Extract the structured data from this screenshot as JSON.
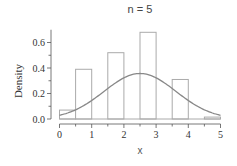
{
  "chart_data": {
    "type": "bar",
    "subtype": "histogram_with_density_curve",
    "title": "n = 5",
    "xlabel": "x",
    "ylabel": "Density",
    "xlim": [
      0,
      5
    ],
    "ylim": [
      0,
      0.7
    ],
    "x_ticks": [
      0,
      1,
      2,
      3,
      4,
      5
    ],
    "x_tick_labels": [
      "0",
      "1",
      "2",
      "3",
      "4",
      "5"
    ],
    "y_ticks": [
      0.0,
      0.2,
      0.4,
      0.6
    ],
    "y_tick_labels": [
      "0.0",
      "0.2",
      "0.4",
      "0.6"
    ],
    "y_minor_ticks": [
      0.1,
      0.3,
      0.5
    ],
    "grid": false,
    "legend": null,
    "bins": [
      {
        "x0": 0.0,
        "x1": 0.5,
        "density": 0.07
      },
      {
        "x0": 0.5,
        "x1": 1.0,
        "density": 0.39
      },
      {
        "x0": 1.5,
        "x1": 2.0,
        "density": 0.52
      },
      {
        "x0": 2.5,
        "x1": 3.0,
        "density": 0.68
      },
      {
        "x0": 3.5,
        "x1": 4.0,
        "density": 0.31
      },
      {
        "x0": 4.5,
        "x1": 5.0,
        "density": 0.015
      }
    ],
    "categories": [
      "0-0.5",
      "0.5-1",
      "1.5-2",
      "2.5-3",
      "3.5-4",
      "4.5-5"
    ],
    "values": [
      0.07,
      0.39,
      0.52,
      0.68,
      0.31,
      0.015
    ],
    "series": [
      {
        "name": "histogram",
        "values": [
          0.07,
          0.39,
          0.52,
          0.68,
          0.31,
          0.015
        ]
      },
      {
        "name": "normal density curve",
        "distribution": "normal",
        "mean": 2.5,
        "sd": 1.118,
        "peak": 0.357
      }
    ],
    "colors": {
      "bar_edge": "#aaaaaa",
      "bar_fill": "#ffffff",
      "curve": "#888888",
      "axis": "#555555"
    }
  }
}
